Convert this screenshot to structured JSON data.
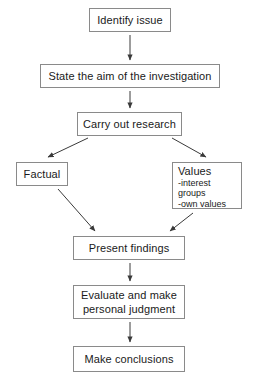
{
  "diagram": {
    "background_color": "#ffffff",
    "box_border_color": "#8a8a8a",
    "text_color": "#1a1a1a",
    "nodes": [
      {
        "id": "identify",
        "label": "Identify issue"
      },
      {
        "id": "aim",
        "label": "State the aim of the investigation"
      },
      {
        "id": "research",
        "label": "Carry out research"
      },
      {
        "id": "factual",
        "label": "Factual"
      },
      {
        "id": "values",
        "label": "Values",
        "sub_items": [
          "-interest groups",
          "-own values"
        ]
      },
      {
        "id": "present",
        "label": "Present findings"
      },
      {
        "id": "evaluate",
        "label_line1": "Evaluate and make",
        "label_line2": "personal judgment"
      },
      {
        "id": "conclusions",
        "label": "Make conclusions"
      }
    ],
    "edges": [
      {
        "from": "identify",
        "to": "aim",
        "style": "straight-down"
      },
      {
        "from": "aim",
        "to": "research",
        "style": "straight-down"
      },
      {
        "from": "research",
        "to": "factual",
        "style": "diagonal-left"
      },
      {
        "from": "research",
        "to": "values",
        "style": "diagonal-right"
      },
      {
        "from": "factual",
        "to": "present",
        "style": "diagonal-right"
      },
      {
        "from": "values",
        "to": "present",
        "style": "diagonal-left"
      },
      {
        "from": "present",
        "to": "evaluate",
        "style": "straight-down"
      },
      {
        "from": "evaluate",
        "to": "conclusions",
        "style": "straight-down"
      }
    ]
  }
}
